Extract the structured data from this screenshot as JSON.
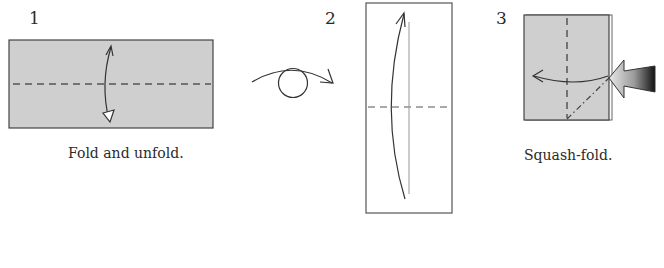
{
  "colors": {
    "paper_fill": "#cfcfcf",
    "line": "#3a3a3a",
    "background": "#ffffff"
  },
  "steps": [
    {
      "number": "1",
      "caption": "Fold and unfold."
    },
    {
      "number": "2",
      "caption": ""
    },
    {
      "number": "3",
      "caption": "Squash-fold."
    }
  ],
  "icons": [
    "fold-unfold-arrow-icon",
    "turn-over-icon",
    "fold-up-arrow-icon",
    "valley-fold-arrow-icon",
    "push-arrow-icon"
  ]
}
